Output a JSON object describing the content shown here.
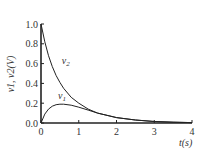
{
  "chart_data": {
    "type": "line",
    "title": "",
    "xlabel": "t(s)",
    "ylabel": "v1, v2(V)",
    "xlim": [
      0,
      4
    ],
    "ylim": [
      0,
      1.0
    ],
    "grid": false,
    "x_ticks": [
      "0",
      "1",
      "2",
      "3",
      "4"
    ],
    "y_ticks": [
      "0.0",
      "0.2",
      "0.4",
      "0.6",
      "0.8",
      "1.0"
    ],
    "series": [
      {
        "name": "v2",
        "x": [
          0,
          0.1,
          0.2,
          0.3,
          0.4,
          0.5,
          0.6,
          0.8,
          1.0,
          1.25,
          1.5,
          2.0,
          2.5,
          3.0,
          3.5,
          4.0
        ],
        "values": [
          1.0,
          0.82,
          0.68,
          0.57,
          0.48,
          0.41,
          0.35,
          0.26,
          0.2,
          0.14,
          0.1,
          0.055,
          0.03,
          0.015,
          0.008,
          0.004
        ]
      },
      {
        "name": "v1",
        "x": [
          0,
          0.1,
          0.2,
          0.3,
          0.4,
          0.5,
          0.6,
          0.8,
          1.0,
          1.25,
          1.5,
          2.0,
          2.5,
          3.0,
          3.5,
          4.0
        ],
        "values": [
          0.0,
          0.09,
          0.14,
          0.17,
          0.185,
          0.19,
          0.19,
          0.18,
          0.16,
          0.13,
          0.1,
          0.055,
          0.03,
          0.015,
          0.008,
          0.004
        ]
      }
    ],
    "annotations": [
      {
        "text": "v2",
        "x": 0.55,
        "y": 0.6
      },
      {
        "text": "v1",
        "x": 0.45,
        "y": 0.24
      }
    ]
  }
}
